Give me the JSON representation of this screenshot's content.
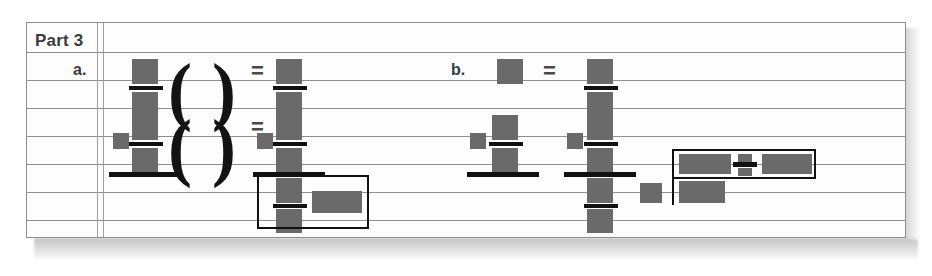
{
  "document": {
    "type": "scanned-worksheet",
    "section_label": "Part 3",
    "problems": [
      {
        "id": "a",
        "label": "a."
      },
      {
        "id": "b",
        "label": "b."
      }
    ],
    "operators": {
      "equals": "=",
      "paren_open": "(",
      "paren_close": ")"
    },
    "notes": {
      "redacted": "All numerals are obscured by solid gray redaction blocks.",
      "ruling": "Lined notebook-style paper with a double vertical margin rule."
    }
  },
  "colors": {
    "paper": "#fdfdfd",
    "rule_line": "#8f8f8f",
    "margin_rule": "#a0a0a0",
    "redaction_block": "#6a6a6a",
    "fraction_bar": "#121212",
    "text": "#3b3b3b",
    "answer_box_border": "#111111",
    "page_border": "#8d8d8d"
  },
  "layout": {
    "paper": {
      "x": 26,
      "y": 22,
      "w": 880,
      "h": 216
    },
    "rules_y": [
      30,
      58,
      86,
      114,
      142,
      170,
      198
    ],
    "vrules_x": [
      70,
      76
    ],
    "answer_boxes": [
      {
        "name": "answer-box-a",
        "x": 230,
        "y": 142,
        "w": 112,
        "h": 52
      },
      {
        "name": "answer-box-b-top",
        "x": 645,
        "y": 126,
        "w": 144,
        "h": 28
      },
      {
        "name": "answer-box-b-bottom",
        "x": 645,
        "y": 154,
        "w": 144,
        "h": 28
      }
    ]
  }
}
